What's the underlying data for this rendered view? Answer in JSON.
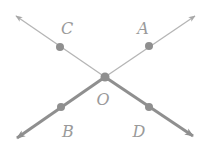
{
  "diagram": {
    "center": {
      "label": "O",
      "x": 105,
      "y": 77,
      "label_x": 103,
      "label_y": 105
    },
    "points": [
      {
        "label": "C",
        "x": 60,
        "y": 47,
        "label_x": 67,
        "label_y": 34
      },
      {
        "label": "A",
        "x": 149,
        "y": 46,
        "label_x": 143,
        "label_y": 34
      },
      {
        "label": "B",
        "x": 61,
        "y": 107,
        "label_x": 68,
        "label_y": 137
      },
      {
        "label": "D",
        "x": 149,
        "y": 107,
        "label_x": 139,
        "label_y": 137
      }
    ],
    "rays": [
      {
        "name": "ray-OC",
        "tip_x": 16,
        "tip_y": 16,
        "bold": false
      },
      {
        "name": "ray-OA",
        "tip_x": 195,
        "tip_y": 16,
        "bold": false
      },
      {
        "name": "ray-OB",
        "tip_x": 17,
        "tip_y": 138,
        "bold": true
      },
      {
        "name": "ray-OD",
        "tip_x": 193,
        "tip_y": 136,
        "bold": true
      }
    ],
    "colors": {
      "thin_line": "#b5b5b5",
      "bold_line": "#8f8f8f",
      "point": "#8f8f8f",
      "label": "#9a9a9a"
    }
  }
}
